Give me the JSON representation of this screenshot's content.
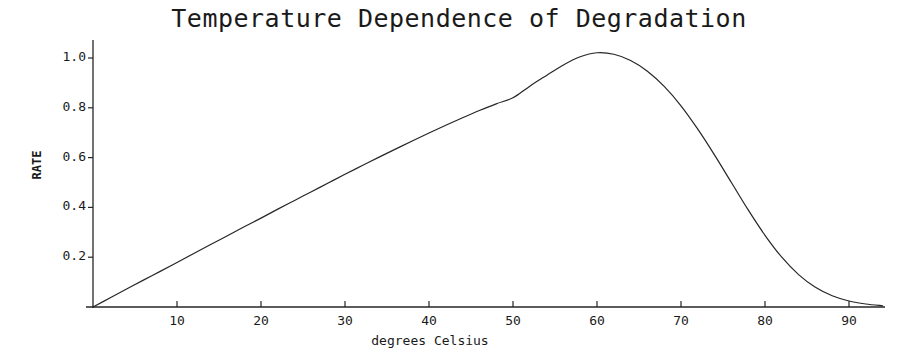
{
  "chart_data": {
    "type": "line",
    "title": "Temperature Dependence of Degradation",
    "xlabel": "degrees Celsius",
    "ylabel": "RATE",
    "xlim": [
      0,
      94
    ],
    "ylim": [
      0,
      1.1
    ],
    "grid": false,
    "legend": null,
    "xticks": [
      10,
      20,
      30,
      40,
      50,
      60,
      70,
      80,
      90
    ],
    "xtick_labels": [
      "10",
      "20",
      "30",
      "40",
      "50",
      "60",
      "70",
      "80",
      "90"
    ],
    "yticks": [
      0.2,
      0.4,
      0.6,
      0.8,
      1.0
    ],
    "ytick_labels": [
      "0.2",
      "0.4",
      "0.6",
      "0.8",
      "1.0"
    ],
    "line_color": "#262626",
    "line_width": 1.2,
    "series": [
      {
        "name": "rate",
        "x": [
          0,
          2,
          4,
          6,
          8,
          10,
          12,
          14,
          16,
          18,
          20,
          22,
          24,
          26,
          28,
          30,
          32,
          34,
          36,
          38,
          40,
          42,
          44,
          46,
          48,
          50,
          52,
          54,
          56,
          58,
          60,
          62,
          64,
          66,
          68,
          70,
          72,
          74,
          76,
          78,
          80,
          82,
          84,
          86,
          88,
          90,
          92,
          94
        ],
        "values": [
          0.0,
          0.036,
          0.072,
          0.108,
          0.143,
          0.179,
          0.215,
          0.251,
          0.286,
          0.322,
          0.357,
          0.393,
          0.428,
          0.463,
          0.498,
          0.533,
          0.567,
          0.601,
          0.634,
          0.667,
          0.699,
          0.73,
          0.76,
          0.789,
          0.816,
          0.84,
          0.887,
          0.93,
          0.972,
          1.005,
          1.021,
          1.015,
          0.99,
          0.947,
          0.886,
          0.808,
          0.714,
          0.61,
          0.5,
          0.39,
          0.288,
          0.2,
          0.13,
          0.079,
          0.045,
          0.024,
          0.012,
          0.005
        ]
      }
    ]
  },
  "axes_geometry": {
    "origin_x": 93,
    "origin_y": 307,
    "x_per_unit": 8.4,
    "y_top_value_px": 58,
    "plot_right_px": 885,
    "y_axis_top_px": 40
  }
}
